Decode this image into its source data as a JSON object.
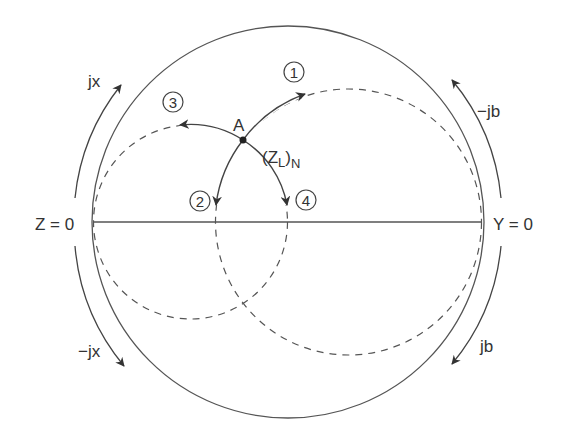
{
  "diagram": {
    "colors": {
      "line": "#555555",
      "text": "#333333",
      "background": "#ffffff"
    },
    "labels": {
      "z_zero": "Z = 0",
      "y_zero": "Y = 0",
      "jx": "jx",
      "neg_jx": "−jx",
      "neg_jb": "−jb",
      "jb": "jb",
      "point_a": "A",
      "zl": "(Z",
      "zl_sub": "L",
      "zl_close": ")",
      "zl_n": "N",
      "path1": "1",
      "path2": "2",
      "path3": "3",
      "path4": "4"
    },
    "elements": {
      "outer_circle": {
        "cx": 288,
        "cy": 222,
        "r": 195
      },
      "constant_resistance_circle": {
        "cx": 190.5,
        "cy": 222,
        "r": 97,
        "style": "dashed"
      },
      "constant_conductance_circle": {
        "cx": 348.5,
        "cy": 222,
        "r": 133,
        "style": "dashed"
      },
      "point_a": {
        "x": 243,
        "y": 140
      }
    }
  }
}
